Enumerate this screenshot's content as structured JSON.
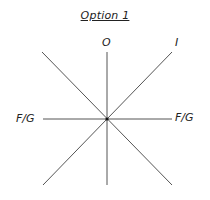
{
  "title": "Option 1",
  "labels": {
    "top": "O",
    "top_right": "I",
    "left": "F/G",
    "right": "F/G"
  },
  "diagram": {
    "center": [
      107,
      119
    ],
    "line_color": "#555555",
    "lines": [
      {
        "name": "vertical",
        "from": [
          107,
          52
        ],
        "to": [
          107,
          185
        ]
      },
      {
        "name": "horizontal",
        "from": [
          43,
          119
        ],
        "to": [
          172,
          119
        ]
      },
      {
        "name": "diagonal-up-right",
        "from": [
          43,
          185
        ],
        "to": [
          172,
          52
        ]
      },
      {
        "name": "diagonal-down-right",
        "from": [
          42,
          52
        ],
        "to": [
          172,
          185
        ]
      }
    ]
  }
}
